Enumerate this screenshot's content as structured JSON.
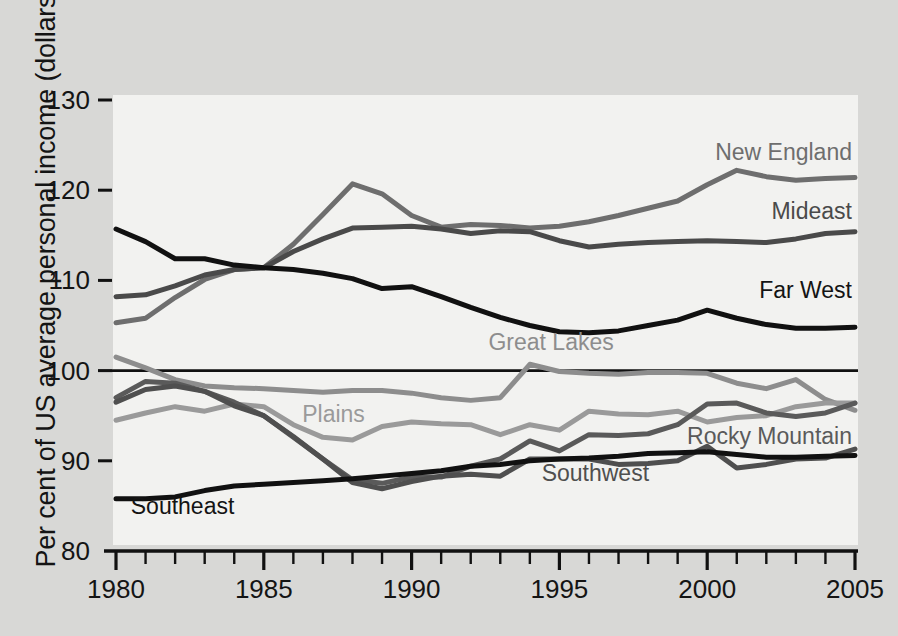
{
  "chart_data": {
    "type": "line",
    "title": "",
    "xlabel": "",
    "ylabel": "Per cent of US average personal income (dollars)",
    "xlim": [
      1980,
      2005
    ],
    "ylim": [
      80,
      130
    ],
    "ytick_labels": [
      "130",
      "120",
      "110",
      "100",
      "90",
      "80"
    ],
    "ytick_values": [
      130,
      120,
      110,
      100,
      90,
      80
    ],
    "xtick_labels": [
      "1980",
      "1985",
      "1990",
      "1995",
      "2000",
      "2005"
    ],
    "xtick_values": [
      1980,
      1985,
      1990,
      1995,
      2000,
      2005
    ],
    "minor_xticks": "every year 1980-2005",
    "grid": false,
    "reference_line": 100,
    "legend_position": "inline-labels-right",
    "x": [
      1980,
      1981,
      1982,
      1983,
      1984,
      1985,
      1986,
      1987,
      1988,
      1989,
      1990,
      1991,
      1992,
      1993,
      1994,
      1995,
      1996,
      1997,
      1998,
      1999,
      2000,
      2001,
      2002,
      2003,
      2004,
      2005
    ],
    "series": [
      {
        "name": "New England",
        "color": "#6e6e6e",
        "label_x": 1999.2,
        "label_y": 123.3,
        "values": [
          105.3,
          105.8,
          108.1,
          110.1,
          111.2,
          111.4,
          114.0,
          117.3,
          120.7,
          119.6,
          117.2,
          115.9,
          116.2,
          116.1,
          115.8,
          116.0,
          116.5,
          117.2,
          118.0,
          118.8,
          120.6,
          122.2,
          121.5,
          121.1,
          121.3,
          121.4
        ]
      },
      {
        "name": "Mideast",
        "color": "#4a4a4a",
        "label_x": 2000.0,
        "label_y": 116.8,
        "values": [
          108.2,
          108.4,
          109.4,
          110.6,
          111.2,
          111.4,
          113.2,
          114.6,
          115.8,
          115.9,
          116.0,
          115.7,
          115.2,
          115.5,
          115.4,
          114.4,
          113.7,
          114.0,
          114.2,
          114.3,
          114.4,
          114.3,
          114.2,
          114.6,
          115.2,
          115.4
        ]
      },
      {
        "name": "Far West",
        "color": "#111111",
        "label_x": 2000.3,
        "label_y": 108.1,
        "values": [
          115.7,
          114.3,
          112.4,
          112.4,
          111.7,
          111.4,
          111.2,
          110.8,
          110.2,
          109.1,
          109.3,
          108.2,
          107.0,
          105.9,
          105.0,
          104.3,
          104.2,
          104.4,
          105.0,
          105.6,
          106.7,
          105.8,
          105.1,
          104.7,
          104.7,
          104.8
        ]
      },
      {
        "name": "Great Lakes",
        "color": "#8d8d8d",
        "label_x": 1992.6,
        "label_y": 102.3,
        "values": [
          101.5,
          100.3,
          99.0,
          98.3,
          98.1,
          98.0,
          97.8,
          97.6,
          97.8,
          97.8,
          97.5,
          97.0,
          96.7,
          97.0,
          100.7,
          99.9,
          99.7,
          99.6,
          99.8,
          99.8,
          99.7,
          98.6,
          98.0,
          99.0,
          96.8,
          95.6
        ]
      },
      {
        "name": "Plains",
        "color": "#9a9a9a",
        "label_x": 1986.3,
        "label_y": 94.3,
        "values": [
          94.5,
          95.3,
          96.0,
          95.5,
          96.3,
          96.0,
          94.0,
          92.6,
          92.3,
          93.8,
          94.3,
          94.1,
          94.0,
          92.9,
          94.0,
          93.4,
          95.5,
          95.2,
          95.1,
          95.5,
          94.3,
          94.8,
          95.0,
          96.0,
          96.4,
          96.4
        ]
      },
      {
        "name": "Rocky Mountain",
        "color": "#5a5a5a",
        "label_x": 1999.0,
        "label_y": 91.9,
        "values": [
          97.0,
          98.8,
          98.6,
          97.7,
          96.5,
          95.0,
          92.6,
          90.2,
          87.9,
          87.5,
          88.2,
          88.2,
          89.4,
          90.2,
          92.2,
          91.1,
          92.9,
          92.8,
          93.0,
          94.0,
          96.3,
          96.4,
          95.3,
          94.9,
          95.3,
          96.4
        ]
      },
      {
        "name": "Southwest",
        "color": "#4f4f4f",
        "label_x": 1994.4,
        "label_y": 87.8,
        "values": [
          96.5,
          97.9,
          98.3,
          97.7,
          96.1,
          95.0,
          92.7,
          90.2,
          87.6,
          86.9,
          87.7,
          88.3,
          88.5,
          88.3,
          90.2,
          90.2,
          90.2,
          89.6,
          89.7,
          90.0,
          91.6,
          89.2,
          89.6,
          90.2,
          90.3,
          91.3
        ]
      },
      {
        "name": "Southeast",
        "color": "#111111",
        "label_x": 1980.5,
        "label_y": 84.1,
        "values": [
          85.8,
          85.8,
          86.0,
          86.7,
          87.2,
          87.4,
          87.6,
          87.8,
          88.0,
          88.3,
          88.6,
          88.9,
          89.4,
          89.6,
          90.0,
          90.2,
          90.3,
          90.5,
          90.8,
          90.9,
          91.0,
          90.7,
          90.4,
          90.4,
          90.5,
          90.6
        ]
      }
    ]
  },
  "figure": {
    "background_color": "#d8d8d6",
    "plot_background_color": "#f2f2f0",
    "axis_color": "#111111"
  }
}
